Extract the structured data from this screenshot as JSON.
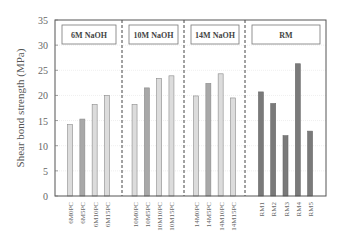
{
  "chart_data": {
    "type": "bar",
    "title": "",
    "xlabel": "",
    "ylabel": "Shear bond strength (MPa)",
    "ylim": [
      0,
      35
    ],
    "yticks": [
      0,
      5,
      10,
      15,
      20,
      25,
      30,
      35
    ],
    "ytick_labels": [
      "0",
      "5",
      "10",
      "15",
      "20",
      "25",
      "30",
      "35"
    ],
    "grid": "horizontal",
    "groups": [
      {
        "label": "6M NaOH",
        "categories": [
          "6M0PC",
          "6M5PC",
          "6M10PC",
          "6M15PC"
        ],
        "values": [
          14.2,
          15.3,
          18.2,
          20.0
        ],
        "colors": [
          "#dcdcdc",
          "#a8a8a8",
          "#dcdcdc",
          "#dcdcdc"
        ]
      },
      {
        "label": "10M NaOH",
        "categories": [
          "10M0PC",
          "10M5PC",
          "10M10PC",
          "10M15PC"
        ],
        "values": [
          18.2,
          21.5,
          23.4,
          23.9
        ],
        "colors": [
          "#dcdcdc",
          "#a8a8a8",
          "#dcdcdc",
          "#dcdcdc"
        ]
      },
      {
        "label": "14M NaOH",
        "categories": [
          "14M0PC",
          "14M5PC",
          "14M10PC",
          "14M15PC"
        ],
        "values": [
          19.9,
          22.4,
          24.3,
          19.5
        ],
        "colors": [
          "#dcdcdc",
          "#a8a8a8",
          "#dcdcdc",
          "#dcdcdc"
        ]
      },
      {
        "label": "RM",
        "categories": [
          "RM1",
          "RM2",
          "RM3",
          "RM4",
          "RM5"
        ],
        "values": [
          20.7,
          18.4,
          12.0,
          26.3,
          12.9
        ],
        "colors": [
          "#7a7a7a",
          "#7a7a7a",
          "#7a7a7a",
          "#7a7a7a",
          "#7a7a7a"
        ]
      }
    ]
  }
}
